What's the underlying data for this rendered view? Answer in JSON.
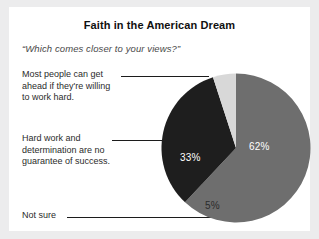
{
  "chart_data": {
    "type": "pie",
    "title": "Faith in the American Dream",
    "subtitle": "“Which comes closer to your views?”",
    "categories": [
      "Most people can get ahead if they're willing to work hard.",
      "Hard work and determination are no guarantee of success.",
      "Not sure"
    ],
    "values": [
      62,
      33,
      5
    ],
    "value_labels": [
      "62%",
      "33%",
      "5%"
    ],
    "colors": [
      "#6e6e6e",
      "#1e1e1e",
      "#d8d8d8"
    ],
    "legend": "callout-labels-left",
    "grid": false,
    "xlabel": "",
    "ylabel": "",
    "start_angle_deg": 0,
    "direction": "clockwise"
  },
  "labels": {
    "majority": "Most people can get\nahead if they're willing\nto work hard.",
    "skeptic": "Hard work and\ndetermination are no\nguarantee of success.",
    "notsure": "Not sure"
  },
  "style": {
    "card_background": "#ffffff",
    "page_background": "#ececed"
  }
}
